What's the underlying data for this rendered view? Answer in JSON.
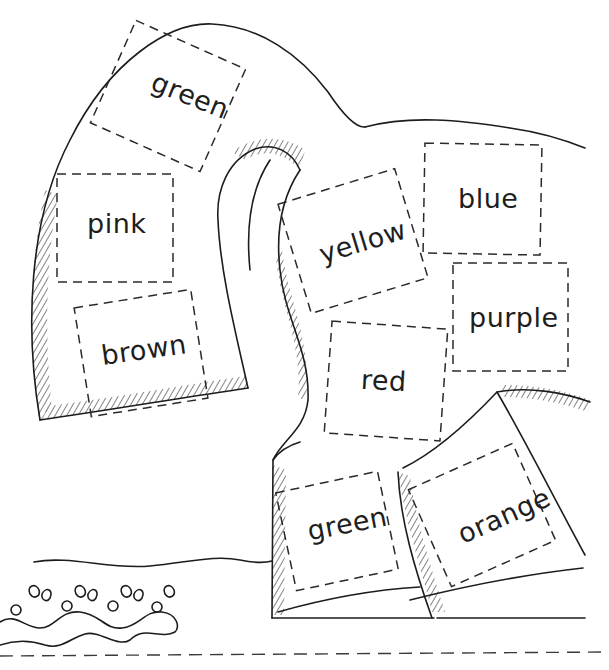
{
  "worksheet": {
    "type": "color-by-word coloring page",
    "subject": "elephant",
    "line_color": "#1c1c1c",
    "background": "#ffffff",
    "regions": [
      {
        "id": "ear-top",
        "label": "green",
        "x": 108,
        "y": 40,
        "w": 120,
        "h": 112,
        "rotate": 24
      },
      {
        "id": "ear-left",
        "label": "pink",
        "x": 57,
        "y": 174,
        "w": 116,
        "h": 108,
        "rotate": 0
      },
      {
        "id": "ear-lower",
        "label": "brown",
        "x": 82,
        "y": 298,
        "w": 118,
        "h": 110,
        "rotate": -9
      },
      {
        "id": "body-center",
        "label": "yellow",
        "x": 292,
        "y": 184,
        "w": 122,
        "h": 114,
        "rotate": -17
      },
      {
        "id": "body-upper-right",
        "label": "blue",
        "x": 424,
        "y": 144,
        "w": 117,
        "h": 110,
        "rotate": 1
      },
      {
        "id": "body-right",
        "label": "purple",
        "x": 453,
        "y": 263,
        "w": 115,
        "h": 108,
        "rotate": 0
      },
      {
        "id": "body-lower",
        "label": "red",
        "x": 328,
        "y": 325,
        "w": 116,
        "h": 112,
        "rotate": 4
      },
      {
        "id": "front-leg",
        "label": "green",
        "x": 285,
        "y": 481,
        "w": 104,
        "h": 100,
        "rotate": -12
      },
      {
        "id": "back-leg",
        "label": "orange",
        "x": 425,
        "y": 462,
        "w": 114,
        "h": 106,
        "rotate": -24
      }
    ],
    "decoration": "wavy grass border with water drops",
    "cut_line": "dashed line across bottom"
  }
}
